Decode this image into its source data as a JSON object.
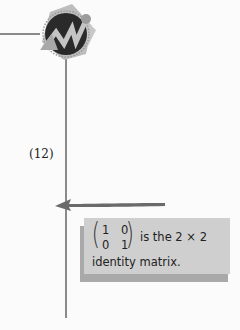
{
  "logo": {
    "icon": "rising-graph-badge-icon"
  },
  "equation": {
    "number": "(12)"
  },
  "callout": {
    "matrix": {
      "r1c1": "1",
      "r1c2": "0",
      "r2c1": "0",
      "r2c2": "1"
    },
    "line1": "is the 2 × 2",
    "line2": "identity matrix."
  },
  "colors": {
    "line": "#8a8a8a",
    "note_bg": "#cfcfcf",
    "note_shadow": "#a9a9a9",
    "arrow": "#6a6a6a",
    "logo_circle": "#2a2a2a",
    "logo_accent": "#b0b0b0"
  }
}
